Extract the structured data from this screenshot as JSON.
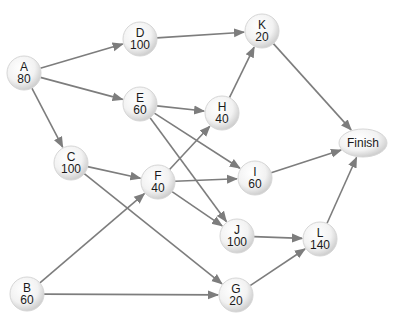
{
  "diagram": {
    "type": "activity-network",
    "nodes": [
      {
        "id": "A",
        "label": "A",
        "value": "80",
        "x": 24,
        "y": 73
      },
      {
        "id": "B",
        "label": "B",
        "value": "60",
        "x": 27,
        "y": 294
      },
      {
        "id": "C",
        "label": "C",
        "value": "100",
        "x": 71,
        "y": 163
      },
      {
        "id": "D",
        "label": "D",
        "value": "100",
        "x": 140,
        "y": 39
      },
      {
        "id": "E",
        "label": "E",
        "value": "60",
        "x": 140,
        "y": 104
      },
      {
        "id": "F",
        "label": "F",
        "value": "40",
        "x": 158,
        "y": 182
      },
      {
        "id": "G",
        "label": "G",
        "value": "20",
        "x": 236,
        "y": 295
      },
      {
        "id": "H",
        "label": "H",
        "value": "40",
        "x": 222,
        "y": 113
      },
      {
        "id": "I",
        "label": "I",
        "value": "60",
        "x": 255,
        "y": 178
      },
      {
        "id": "J",
        "label": "J",
        "value": "100",
        "x": 237,
        "y": 236
      },
      {
        "id": "K",
        "label": "K",
        "value": "20",
        "x": 262,
        "y": 31
      },
      {
        "id": "L",
        "label": "L",
        "value": "140",
        "x": 320,
        "y": 239
      },
      {
        "id": "Finish",
        "label": "Finish",
        "value": "",
        "x": 363,
        "y": 143
      }
    ],
    "edges": [
      [
        "A",
        "D"
      ],
      [
        "A",
        "E"
      ],
      [
        "A",
        "C"
      ],
      [
        "D",
        "K"
      ],
      [
        "E",
        "H"
      ],
      [
        "E",
        "I"
      ],
      [
        "E",
        "J"
      ],
      [
        "C",
        "F"
      ],
      [
        "C",
        "G"
      ],
      [
        "B",
        "F"
      ],
      [
        "B",
        "G"
      ],
      [
        "F",
        "H"
      ],
      [
        "F",
        "I"
      ],
      [
        "F",
        "J"
      ],
      [
        "H",
        "K"
      ],
      [
        "K",
        "Finish"
      ],
      [
        "I",
        "Finish"
      ],
      [
        "J",
        "L"
      ],
      [
        "G",
        "L"
      ],
      [
        "L",
        "Finish"
      ]
    ],
    "colors": {
      "edge": "#7d7d7d",
      "node_fill": "#f4f4f4",
      "node_edge": "#d6d6d6",
      "text": "#1a1a1a"
    }
  }
}
